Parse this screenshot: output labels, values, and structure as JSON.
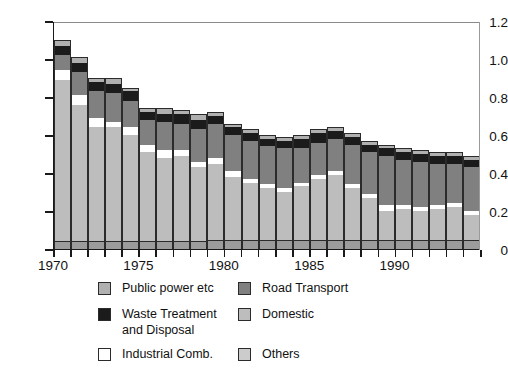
{
  "chart_data": {
    "type": "bar",
    "stacked": true,
    "title": "",
    "subtitle": "",
    "xlabel": "",
    "ylabel": "",
    "ylim": [
      0,
      1.2
    ],
    "yticks": [
      0,
      0.2,
      0.4,
      0.6,
      0.8,
      1.0,
      1.2
    ],
    "ytick_labels": [
      "0",
      "0.2",
      "0.4",
      "0.6",
      "0.8",
      "1.0",
      "1.2"
    ],
    "xlim": [
      1969.5,
      1994.5
    ],
    "xticks": [
      1970,
      1971,
      1972,
      1973,
      1974,
      1975,
      1976,
      1977,
      1978,
      1979,
      1980,
      1981,
      1982,
      1983,
      1984,
      1985,
      1986,
      1987,
      1988,
      1989,
      1990,
      1991,
      1992,
      1993,
      1994
    ],
    "xtick_labels_shown": [
      "1970",
      "1975",
      "1980",
      "1985",
      "1990"
    ],
    "grid": false,
    "legend_position": "bottom",
    "categories": [
      "1970",
      "1971",
      "1972",
      "1973",
      "1974",
      "1975",
      "1976",
      "1977",
      "1978",
      "1979",
      "1980",
      "1981",
      "1982",
      "1983",
      "1984",
      "1985",
      "1986",
      "1987",
      "1988",
      "1989",
      "1990",
      "1991",
      "1992",
      "1993",
      "1994"
    ],
    "stack_order_bottom_to_top": [
      "Others",
      "Domestic",
      "Industrial Comb.",
      "Road Transport",
      "Waste Treatment and Disposal",
      "Public power etc"
    ],
    "series": [
      {
        "name": "Others",
        "color": "#9c9c9c",
        "values": [
          0.04,
          0.04,
          0.04,
          0.04,
          0.04,
          0.04,
          0.04,
          0.04,
          0.04,
          0.05,
          0.05,
          0.05,
          0.05,
          0.05,
          0.05,
          0.05,
          0.05,
          0.05,
          0.05,
          0.05,
          0.05,
          0.05,
          0.05,
          0.05,
          0.05
        ]
      },
      {
        "name": "Domestic",
        "color": "#bdbdbd",
        "values": [
          0.85,
          0.72,
          0.6,
          0.6,
          0.56,
          0.47,
          0.44,
          0.45,
          0.39,
          0.4,
          0.33,
          0.3,
          0.27,
          0.25,
          0.28,
          0.32,
          0.34,
          0.27,
          0.22,
          0.15,
          0.16,
          0.15,
          0.16,
          0.17,
          0.13
        ]
      },
      {
        "name": "Industrial Comb.",
        "color": "#ffffff",
        "values": [
          0.05,
          0.05,
          0.05,
          0.03,
          0.04,
          0.04,
          0.04,
          0.03,
          0.03,
          0.03,
          0.03,
          0.02,
          0.02,
          0.02,
          0.02,
          0.02,
          0.02,
          0.02,
          0.02,
          0.03,
          0.02,
          0.02,
          0.02,
          0.02,
          0.02
        ]
      },
      {
        "name": "Road Transport",
        "color": "#808080",
        "values": [
          0.08,
          0.12,
          0.14,
          0.15,
          0.14,
          0.13,
          0.15,
          0.14,
          0.17,
          0.18,
          0.19,
          0.2,
          0.2,
          0.21,
          0.18,
          0.17,
          0.17,
          0.21,
          0.22,
          0.26,
          0.24,
          0.24,
          0.22,
          0.21,
          0.23
        ]
      },
      {
        "name": "Waste Treatment and Disposal",
        "color": "#1b1b1b",
        "values": [
          0.05,
          0.05,
          0.05,
          0.05,
          0.05,
          0.04,
          0.04,
          0.05,
          0.05,
          0.04,
          0.04,
          0.04,
          0.04,
          0.04,
          0.05,
          0.05,
          0.04,
          0.04,
          0.04,
          0.04,
          0.04,
          0.04,
          0.04,
          0.04,
          0.04
        ]
      },
      {
        "name": "Public power etc",
        "color": "#b0b0b0",
        "values": [
          0.03,
          0.03,
          0.02,
          0.03,
          0.02,
          0.02,
          0.03,
          0.02,
          0.03,
          0.02,
          0.02,
          0.02,
          0.02,
          0.02,
          0.02,
          0.02,
          0.02,
          0.02,
          0.02,
          0.02,
          0.02,
          0.02,
          0.02,
          0.02,
          0.02
        ]
      }
    ],
    "totals": [
      1.1,
      0.96,
      0.86,
      0.86,
      0.82,
      0.71,
      0.7,
      0.71,
      0.67,
      0.68,
      0.62,
      0.6,
      0.57,
      0.56,
      0.57,
      0.6,
      0.61,
      0.58,
      0.54,
      0.52,
      0.5,
      0.49,
      0.48,
      0.48,
      0.47
    ]
  },
  "legend": {
    "items": [
      {
        "label": "Public power etc",
        "swatch": "sw-public",
        "icon": "legend-swatch-public-power"
      },
      {
        "label": "Road Transport",
        "swatch": "sw-road",
        "icon": "legend-swatch-road-transport"
      },
      {
        "label": "Waste Treatment\nand Disposal",
        "swatch": "sw-waste",
        "icon": "legend-swatch-waste-treatment"
      },
      {
        "label": "Domestic",
        "swatch": "sw-domestic",
        "icon": "legend-swatch-domestic"
      },
      {
        "label": "Industrial Comb.",
        "swatch": "sw-indust",
        "icon": "legend-swatch-industrial-comb"
      },
      {
        "label": "Others",
        "swatch": "sw-others",
        "icon": "legend-swatch-others"
      }
    ]
  },
  "colors": {
    "public_power": "#b0b0b0",
    "waste_treatment": "#1b1b1b",
    "industrial_comb": "#ffffff",
    "road_transport": "#808080",
    "domestic": "#bdbdbd",
    "others": "#9c9c9c",
    "axis": "#1a1a1a",
    "background": "#ffffff"
  }
}
